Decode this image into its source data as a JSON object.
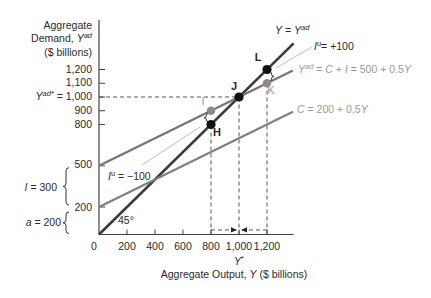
{
  "axes": {
    "y_title": {
      "line1": "Aggregate",
      "line2_prefix": "Demand, ",
      "line2_var": "Y",
      "line2_sup": "ad",
      "line3": "($ billions)"
    },
    "y_ticks": {
      "t1200": "1,200",
      "t1100": "1,100",
      "t1000_var": "Y",
      "t1000_sup": "ad*",
      "t1000_value": " = 1,000",
      "t900": "900",
      "t800": "800",
      "t500": "500",
      "t200": "200"
    },
    "x_ticks": [
      "0",
      "200",
      "400",
      "600",
      "800",
      "1,000",
      "1,200"
    ],
    "x_star": {
      "var": "Y",
      "sup": "*"
    },
    "x_title": {
      "prefix": "Aggregate Output, ",
      "var": "Y",
      "suffix": " ($ billions)"
    }
  },
  "braces": {
    "investment": {
      "var": "I",
      "value": " = 300"
    },
    "autonomous": {
      "var": "a",
      "value": " = 200"
    }
  },
  "labels": {
    "line_45": {
      "v1": "Y",
      "eq": " = ",
      "v2": "Y",
      "sup": "ad"
    },
    "iu_plus": {
      "v": "I",
      "sup": "u",
      "text": "= +100"
    },
    "iu_minus": {
      "v": "I",
      "sup": "u",
      "text": " = −100"
    },
    "yad_eq": {
      "v1": "Y",
      "sup": "ad",
      "t1": " = ",
      "v2": "C",
      "t2": " + ",
      "v3": "I",
      "t3": " = 500 + 0.5",
      "v4": "Y"
    },
    "c_eq": {
      "v1": "C",
      "t1": " = 200 + 0.5",
      "v2": "Y"
    },
    "angle": "45°"
  },
  "points": {
    "L": "L",
    "J": "J",
    "I": "I",
    "K": "K",
    "H": "H"
  },
  "chart_data": {
    "type": "line",
    "title": "",
    "xlabel": "Aggregate Output, Y ($ billions)",
    "ylabel": "Aggregate Demand, Yad ($ billions)",
    "xlim": [
      0,
      1390
    ],
    "ylim": [
      0,
      1560
    ],
    "x_ticks": [
      0,
      200,
      400,
      600,
      800,
      1000,
      1200
    ],
    "y_ticks": [
      200,
      500,
      800,
      900,
      1000,
      1100,
      1200
    ],
    "grid": false,
    "series": [
      {
        "name": "Y = Yad",
        "x": [
          0,
          1390
        ],
        "y": [
          0,
          1390
        ],
        "color": "#3b3b3b",
        "width": 2.6
      },
      {
        "name": "Yad = C + I = 500 + 0.5Y",
        "x": [
          0,
          1385
        ],
        "y": [
          500,
          1192.5
        ],
        "color": "#767676",
        "width": 2.3
      },
      {
        "name": "C = 200 + 0.5Y",
        "x": [
          0,
          1385
        ],
        "y": [
          200,
          892.5
        ],
        "color": "#808080",
        "width": 2.3
      }
    ],
    "points": [
      {
        "label": "L",
        "x": 1200,
        "y": 1200,
        "color": "#111111"
      },
      {
        "label": "J",
        "x": 1000,
        "y": 1000,
        "color": "#111111"
      },
      {
        "label": "H",
        "x": 800,
        "y": 800,
        "color": "#111111"
      },
      {
        "label": "I",
        "x": 800,
        "y": 900,
        "color": "#8a8a8a"
      },
      {
        "label": "K",
        "x": 1200,
        "y": 1100,
        "color": "#8a8a8a"
      }
    ],
    "guides": [
      {
        "type": "h",
        "y": 1000,
        "x0": 0,
        "x1": 1000
      },
      {
        "type": "v",
        "x": 800,
        "y0": 0,
        "y1": 790
      },
      {
        "type": "v",
        "x": 1000,
        "y0": 0,
        "y1": 1000
      },
      {
        "type": "v",
        "x": 1200,
        "y0": 0,
        "y1": 1090
      }
    ],
    "arrows": [
      {
        "y": 33,
        "from": 800,
        "to": 1000
      },
      {
        "y": 33,
        "from": 1200,
        "to": 1000
      }
    ],
    "leaders": [
      {
        "label": "Iu = +100",
        "from": [
          1264,
          1211
        ],
        "to": [
          1521,
          1364
        ]
      },
      {
        "label": "Iu = -100",
        "from": [
          721,
          782
        ],
        "to": [
          307,
          505
        ]
      }
    ],
    "gaps": [
      {
        "label": "Iu = -100 (I to H)",
        "x": 800,
        "y_top": 900,
        "y_bottom": 800,
        "side": "left"
      },
      {
        "label": "Iu = +100 (L to K)",
        "x": 1200,
        "y_top": 1200,
        "y_bottom": 1100,
        "side": "right"
      }
    ],
    "annotations": [
      "Y = Yad",
      "Iu = +100",
      "Yad = C + I = 500 + 0.5Y",
      "C = 200 + 0.5Y",
      "Iu = -100",
      "45°",
      "I = 300",
      "a = 200",
      "Yad* = 1,000",
      "Y*"
    ],
    "styles": {
      "axis": "#444444",
      "dash": "#555555",
      "leader": "#b8b8b8",
      "brace": "#333333"
    }
  }
}
